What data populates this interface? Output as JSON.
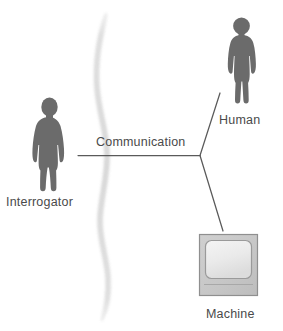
{
  "diagram": {
    "background_color": "#ffffff",
    "figure_color": "#6b6b6b",
    "line_color": "#5a5a5a",
    "label_color": "#4a4a4a",
    "curtain_color": "#e2e2e2",
    "monitor_body_color": "#c8c8c8",
    "monitor_screen_color": "#eeeeee"
  },
  "labels": {
    "interrogator": "Interrogator",
    "human": "Human",
    "machine": "Machine",
    "communication": "Communication"
  },
  "nodes": [
    {
      "id": "interrogator",
      "label": "Interrogator",
      "icon": "person-silhouette-icon",
      "x": 50,
      "y": 145
    },
    {
      "id": "human",
      "label": "Human",
      "icon": "person-silhouette-icon",
      "x": 243,
      "y": 63
    },
    {
      "id": "machine",
      "label": "Machine",
      "icon": "crt-monitor-icon",
      "x": 229,
      "y": 265
    }
  ],
  "connections": [
    {
      "from": "interrogator",
      "to": "junction",
      "label": "Communication",
      "type": "horizontal-line"
    },
    {
      "from": "junction",
      "to": "human",
      "label": "",
      "type": "diagonal-line"
    },
    {
      "from": "junction",
      "to": "machine",
      "label": "",
      "type": "diagonal-line"
    }
  ],
  "separator": {
    "name": "curtain-divider",
    "type": "wavy-vertical-curve",
    "description": "soft gray wavy line separating interrogator from human and machine"
  }
}
